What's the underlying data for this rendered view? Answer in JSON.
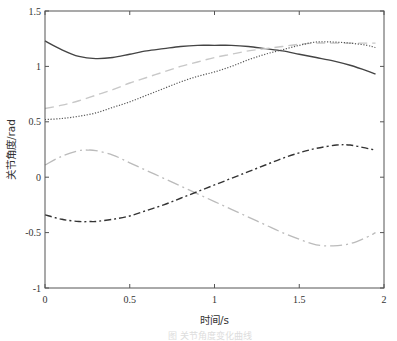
{
  "chart_data": {
    "type": "line",
    "title": "",
    "xlabel": "时间/s",
    "ylabel": "关节角度/rad",
    "xlim": [
      0,
      2
    ],
    "ylim": [
      -1,
      1.5
    ],
    "xticks": [
      0,
      0.5,
      1,
      1.5,
      2
    ],
    "xtick_labels": [
      "0",
      "0.5",
      "1",
      "1.5",
      "2"
    ],
    "yticks": [
      -1,
      -0.5,
      0,
      0.5,
      1,
      1.5
    ],
    "ytick_labels": [
      "-1",
      "-0.5",
      "0",
      "0.5",
      "1",
      "1.5"
    ],
    "grid": false,
    "legend": null,
    "caption": "图 关节角度变化曲线",
    "series": [
      {
        "name": "joint-1",
        "style": "solid",
        "color": "#444444",
        "x": [
          0,
          0.1,
          0.2,
          0.3,
          0.4,
          0.5,
          0.6,
          0.7,
          0.8,
          0.9,
          1.0,
          1.1,
          1.2,
          1.3,
          1.4,
          1.5,
          1.6,
          1.7,
          1.8,
          1.9,
          1.95
        ],
        "y": [
          1.23,
          1.15,
          1.09,
          1.07,
          1.08,
          1.11,
          1.14,
          1.16,
          1.18,
          1.19,
          1.19,
          1.19,
          1.18,
          1.16,
          1.14,
          1.11,
          1.08,
          1.05,
          1.01,
          0.96,
          0.93
        ]
      },
      {
        "name": "joint-2",
        "style": "dashed",
        "color": "#c8c8c8",
        "x": [
          0,
          0.1,
          0.2,
          0.3,
          0.4,
          0.5,
          0.6,
          0.7,
          0.8,
          0.9,
          1.0,
          1.1,
          1.2,
          1.3,
          1.4,
          1.5,
          1.6,
          1.7,
          1.8,
          1.9,
          1.95
        ],
        "y": [
          0.62,
          0.65,
          0.69,
          0.74,
          0.79,
          0.85,
          0.9,
          0.95,
          1.0,
          1.04,
          1.08,
          1.11,
          1.14,
          1.16,
          1.18,
          1.2,
          1.21,
          1.21,
          1.21,
          1.21,
          1.21
        ]
      },
      {
        "name": "joint-3",
        "style": "dotted",
        "color": "#555555",
        "x": [
          0,
          0.1,
          0.2,
          0.3,
          0.4,
          0.5,
          0.6,
          0.7,
          0.8,
          0.9,
          1.0,
          1.1,
          1.2,
          1.3,
          1.4,
          1.5,
          1.6,
          1.7,
          1.8,
          1.9,
          1.95
        ],
        "y": [
          0.52,
          0.53,
          0.55,
          0.58,
          0.63,
          0.68,
          0.74,
          0.8,
          0.86,
          0.91,
          0.95,
          1.0,
          1.06,
          1.11,
          1.15,
          1.19,
          1.22,
          1.22,
          1.21,
          1.19,
          1.17
        ]
      },
      {
        "name": "joint-4",
        "style": "long-dash-dot",
        "color": "#bbbbbb",
        "x": [
          0,
          0.1,
          0.2,
          0.25,
          0.3,
          0.4,
          0.5,
          0.6,
          0.7,
          0.8,
          0.9,
          1.0,
          1.1,
          1.2,
          1.3,
          1.4,
          1.5,
          1.6,
          1.7,
          1.8,
          1.9,
          1.95
        ],
        "y": [
          0.11,
          0.19,
          0.24,
          0.245,
          0.24,
          0.2,
          0.13,
          0.06,
          -0.01,
          -0.08,
          -0.15,
          -0.22,
          -0.29,
          -0.36,
          -0.43,
          -0.5,
          -0.56,
          -0.61,
          -0.62,
          -0.6,
          -0.54,
          -0.5
        ]
      },
      {
        "name": "joint-5",
        "style": "dash-dot",
        "color": "#333333",
        "x": [
          0,
          0.1,
          0.2,
          0.27,
          0.3,
          0.4,
          0.5,
          0.6,
          0.7,
          0.8,
          0.9,
          1.0,
          1.1,
          1.2,
          1.3,
          1.4,
          1.5,
          1.6,
          1.72,
          1.8,
          1.9,
          1.95
        ],
        "y": [
          -0.34,
          -0.38,
          -0.4,
          -0.4,
          -0.4,
          -0.38,
          -0.35,
          -0.3,
          -0.25,
          -0.19,
          -0.13,
          -0.07,
          -0.01,
          0.05,
          0.11,
          0.17,
          0.22,
          0.26,
          0.29,
          0.29,
          0.26,
          0.245
        ]
      }
    ]
  }
}
